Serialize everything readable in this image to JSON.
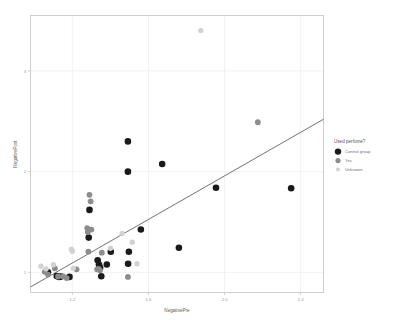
{
  "chart_data": {
    "type": "scatter",
    "title": "",
    "xlabel": "NegativePre",
    "ylabel": "NegativePost",
    "xlim": [
      0.98,
      2.52
    ],
    "ylim": [
      0.8,
      3.55
    ],
    "xticks": [
      1.2,
      1.6,
      2.0,
      2.4
    ],
    "xticklabels": [
      "1.2",
      "1.6",
      "2.0",
      "2.4"
    ],
    "yticks": [
      1,
      2,
      3
    ],
    "yticklabels": [
      "1",
      "2",
      "3"
    ],
    "grid": true,
    "legend": {
      "title": "Used perfume?",
      "position": "right",
      "entries": [
        {
          "label": "Control group",
          "color": "#1a1a1a",
          "size": 3.2
        },
        {
          "label": "Yes",
          "color": "#8c8c8c",
          "size": 2.6
        },
        {
          "label": "Unknown",
          "color": "#d2d2d2",
          "size": 2.0
        }
      ]
    },
    "trendline": {
      "label": "fit",
      "color": "#4f4f4f",
      "x": [
        0.98,
        2.52
      ],
      "y": [
        0.855,
        2.52
      ]
    },
    "series": [
      {
        "name": "Control group",
        "color": "#1a1a1a",
        "radius": 3.3,
        "points": [
          [
            1.072,
            1.0
          ],
          [
            1.118,
            0.963
          ],
          [
            1.131,
            0.955
          ],
          [
            1.141,
            0.958
          ],
          [
            1.185,
            0.955
          ],
          [
            1.286,
            1.345
          ],
          [
            1.29,
            1.62
          ],
          [
            1.333,
            1.12
          ],
          [
            1.34,
            1.078
          ],
          [
            1.343,
            1.05
          ],
          [
            1.346,
            1.045
          ],
          [
            1.352,
            0.962
          ],
          [
            1.381,
            1.078
          ],
          [
            1.402,
            1.205
          ],
          [
            1.492,
            2.3
          ],
          [
            1.492,
            2.0
          ],
          [
            1.493,
            1.085
          ],
          [
            1.497,
            1.205
          ],
          [
            1.56,
            1.425
          ],
          [
            1.672,
            2.075
          ],
          [
            1.76,
            1.245
          ],
          [
            1.955,
            1.84
          ],
          [
            2.35,
            1.835
          ]
        ]
      },
      {
        "name": "Yes",
        "color": "#8c8c8c",
        "radius": 2.9,
        "points": [
          [
            1.055,
            1.005
          ],
          [
            1.072,
            0.978
          ],
          [
            1.108,
            1.04
          ],
          [
            1.125,
            0.96
          ],
          [
            1.152,
            0.96
          ],
          [
            1.17,
            0.943
          ],
          [
            1.222,
            1.03
          ],
          [
            1.278,
            1.44
          ],
          [
            1.281,
            1.4
          ],
          [
            1.284,
            1.205
          ],
          [
            1.29,
            1.77
          ],
          [
            1.296,
            1.705
          ],
          [
            1.3,
            1.425
          ],
          [
            1.33,
            1.03
          ],
          [
            1.338,
            1.035
          ],
          [
            1.345,
            1.02
          ],
          [
            1.355,
            1.195
          ],
          [
            1.492,
            0.955
          ],
          [
            2.175,
            2.49
          ]
        ]
      },
      {
        "name": "Unknown",
        "color": "#d2d2d2",
        "radius": 2.7,
        "points": [
          [
            1.035,
            1.06
          ],
          [
            1.062,
            1.035
          ],
          [
            1.1,
            1.075
          ],
          [
            1.195,
            1.23
          ],
          [
            1.2,
            1.21
          ],
          [
            1.205,
            1.04
          ],
          [
            1.4,
            1.24
          ],
          [
            1.462,
            1.385
          ],
          [
            1.515,
            1.3
          ],
          [
            1.54,
            1.085
          ],
          [
            1.875,
            3.4
          ]
        ]
      }
    ]
  },
  "canvas": {
    "background": "#ffffff",
    "frame_color": "#cfcfcf",
    "grid_color": "#ededed"
  }
}
